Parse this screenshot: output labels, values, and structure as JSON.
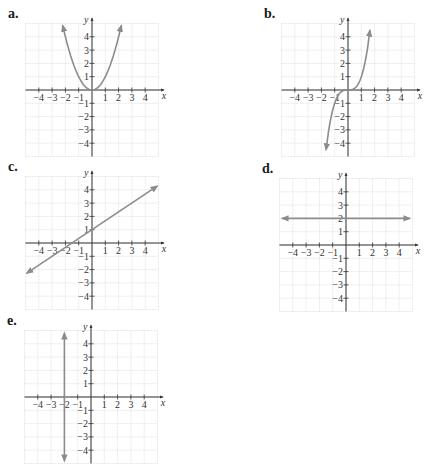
{
  "colors": {
    "grid": "#d9d9d9",
    "axis": "#333333",
    "curve": "#8c8c8c",
    "label": "#1a1a1a"
  },
  "axes": {
    "x_label": "x",
    "y_label": "y",
    "x_ticks": [
      "-4",
      "-3",
      "-2",
      "-1",
      "1",
      "2",
      "3",
      "4"
    ],
    "y_ticks": [
      "4",
      "3",
      "2",
      "1",
      "-1",
      "-2",
      "-3",
      "-4"
    ]
  },
  "panels": [
    {
      "id": "a",
      "label": "a.",
      "origin": [
        92,
        90
      ],
      "curve": "parabola",
      "equation": "y = x^2"
    },
    {
      "id": "b",
      "label": "b.",
      "origin": [
        348,
        90
      ],
      "curve": "cubic",
      "equation": "y = x^3"
    },
    {
      "id": "c",
      "label": "c.",
      "origin": [
        92,
        243
      ],
      "curve": "line",
      "equation": "y = (2/3)x + 1"
    },
    {
      "id": "d",
      "label": "d.",
      "origin": [
        346,
        245
      ],
      "curve": "horizontal",
      "equation": "y = 2"
    },
    {
      "id": "e",
      "label": "e.",
      "origin": [
        91,
        397
      ],
      "curve": "vertical",
      "equation": "x = -2"
    }
  ],
  "chart_data": [
    {
      "type": "line",
      "title": "a.",
      "xlabel": "x",
      "ylabel": "y",
      "xlim": [
        -5,
        5
      ],
      "ylim": [
        -5,
        5
      ],
      "grid": true,
      "series": [
        {
          "name": "y = x^2",
          "x": [
            -2.2,
            -2,
            -1,
            0,
            1,
            2,
            2.2
          ],
          "y": [
            4.84,
            4,
            1,
            0,
            1,
            4,
            4.84
          ]
        }
      ]
    },
    {
      "type": "line",
      "title": "b.",
      "xlabel": "x",
      "ylabel": "y",
      "xlim": [
        -5,
        5
      ],
      "ylim": [
        -5,
        5
      ],
      "grid": true,
      "series": [
        {
          "name": "y = x^3",
          "x": [
            -1.65,
            -1.5,
            -1,
            -0.5,
            0,
            0.5,
            1,
            1.5,
            1.65
          ],
          "y": [
            -4.5,
            -3.375,
            -1,
            -0.125,
            0,
            0.125,
            1,
            3.375,
            4.5
          ]
        }
      ]
    },
    {
      "type": "line",
      "title": "c.",
      "xlabel": "x",
      "ylabel": "y",
      "xlim": [
        -5,
        5
      ],
      "ylim": [
        -5,
        5
      ],
      "grid": true,
      "series": [
        {
          "name": "y = (2/3)x + 1",
          "x": [
            -4.9,
            -1.5,
            0,
            4.9
          ],
          "y": [
            -2.27,
            0,
            1,
            4.27
          ]
        }
      ]
    },
    {
      "type": "line",
      "title": "d.",
      "xlabel": "x",
      "ylabel": "y",
      "xlim": [
        -5,
        5
      ],
      "ylim": [
        -5,
        5
      ],
      "grid": true,
      "series": [
        {
          "name": "y = 2",
          "x": [
            -4.8,
            4.8
          ],
          "y": [
            2,
            2
          ]
        }
      ]
    },
    {
      "type": "line",
      "title": "e.",
      "xlabel": "x",
      "ylabel": "y",
      "xlim": [
        -5,
        5
      ],
      "ylim": [
        -5,
        5
      ],
      "grid": true,
      "series": [
        {
          "name": "x = -2",
          "x": [
            -2,
            -2
          ],
          "y": [
            -4.8,
            4.8
          ]
        }
      ]
    }
  ]
}
